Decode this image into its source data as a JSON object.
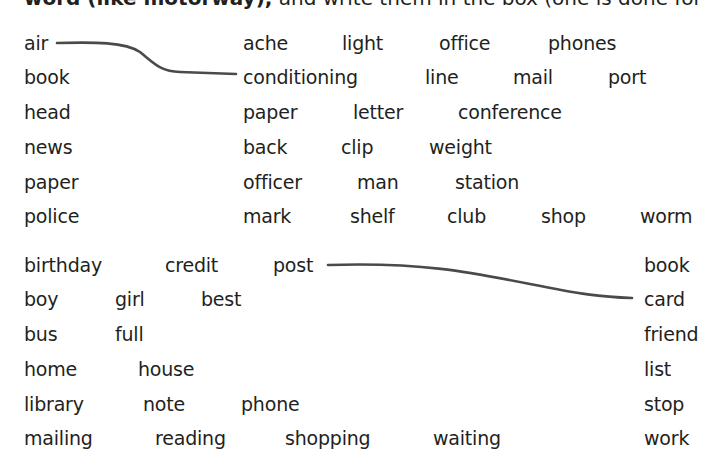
{
  "header": {
    "bold_text": "word (like motorway),",
    "rest_text": " and write them in the box (one is done for"
  },
  "section1": {
    "left_words": [
      "air",
      "book",
      "head",
      "news",
      "paper",
      "police"
    ],
    "right_rows": [
      [
        "ache",
        "light",
        "office",
        "phones"
      ],
      [
        "conditioning",
        "line",
        "mail",
        "port"
      ],
      [
        "paper",
        "letter",
        "conference"
      ],
      [
        "back",
        "clip",
        "weight"
      ],
      [
        "officer",
        "man",
        "station"
      ],
      [
        "mark",
        "shelf",
        "club",
        "shop",
        "worm"
      ]
    ],
    "example_link": {
      "from": "air",
      "to": "conditioning"
    }
  },
  "section2": {
    "left_rows": [
      [
        "birthday",
        "credit",
        "post"
      ],
      [
        "boy",
        "girl",
        "best"
      ],
      [
        "bus",
        "full"
      ],
      [
        "home",
        "house"
      ],
      [
        "library",
        "note",
        "phone"
      ],
      [
        "mailing",
        "reading",
        "shopping",
        "waiting"
      ]
    ],
    "right_words": [
      "book",
      "card",
      "friend",
      "list",
      "stop",
      "work"
    ],
    "example_link": {
      "from": "post",
      "to": "card"
    }
  },
  "colors": {
    "text": "#231f20",
    "line": "#4a4a4a"
  }
}
